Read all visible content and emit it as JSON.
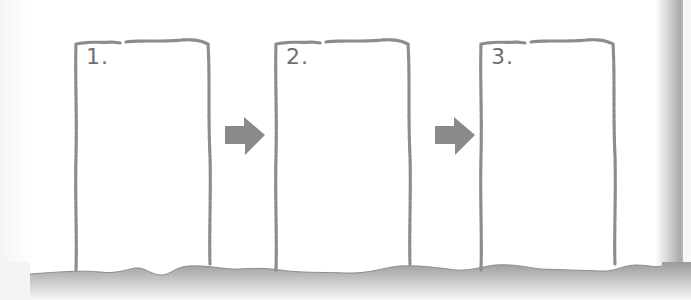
{
  "diagram": {
    "type": "storyboard-sequence",
    "colors": {
      "paper": "#ffffff",
      "frame_stroke": "#8c8c8c",
      "arrow_fill": "#8a8a8a",
      "label_text": "#6e6e6e",
      "shadow": "#a9a9a9"
    },
    "frames": [
      {
        "label": "1."
      },
      {
        "label": "2."
      },
      {
        "label": "3."
      }
    ],
    "arrows": [
      {
        "from": "1.",
        "to": "2.",
        "icon": "arrow-right-icon"
      },
      {
        "from": "2.",
        "to": "3.",
        "icon": "arrow-right-icon"
      }
    ]
  }
}
